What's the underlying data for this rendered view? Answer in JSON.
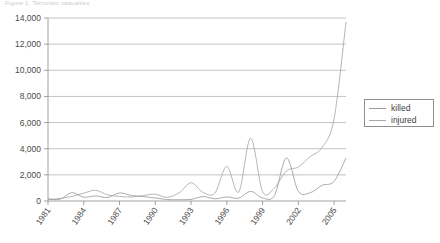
{
  "caption": "Figure 1. Terrorism casualties",
  "legend": {
    "position": "right",
    "items": [
      {
        "label": "killed",
        "icon": "line-swatch-icon",
        "color": "#9b9b9b"
      },
      {
        "label": "injured",
        "icon": "line-swatch-icon",
        "color": "#a8a8a8"
      }
    ]
  },
  "chart_data": {
    "type": "line",
    "title": "",
    "xlabel": "",
    "ylabel": "",
    "grid": true,
    "legend_position": "right",
    "ylim": [
      0,
      14000
    ],
    "ytick_labels": [
      "0",
      "2,000",
      "4,000",
      "6,000",
      "8,000",
      "10,000",
      "12,000",
      "14,000"
    ],
    "ytick_values": [
      0,
      2000,
      4000,
      6000,
      8000,
      10000,
      12000,
      14000
    ],
    "xlim": [
      1981,
      2006
    ],
    "xtick_labels": [
      "1981",
      "1984",
      "1987",
      "1990",
      "1993",
      "1996",
      "1999",
      "2002",
      "2005"
    ],
    "xtick_values": [
      1981,
      1984,
      1987,
      1990,
      1993,
      1996,
      1999,
      2002,
      2005
    ],
    "x": [
      1981,
      1982,
      1983,
      1984,
      1985,
      1986,
      1987,
      1988,
      1989,
      1990,
      1991,
      1992,
      1993,
      1994,
      1995,
      1996,
      1997,
      1998,
      1999,
      2000,
      2001,
      2002,
      2003,
      2004,
      2005,
      2006
    ],
    "series": [
      {
        "name": "killed",
        "color": "#9b9b9b",
        "values": [
          170,
          130,
          640,
          290,
          390,
          270,
          620,
          420,
          340,
          230,
          110,
          100,
          120,
          340,
          170,
          310,
          220,
          740,
          240,
          420,
          3300,
          750,
          630,
          1200,
          1500,
          3300
        ]
      },
      {
        "name": "injured",
        "color": "#a8a8a8",
        "values": [
          100,
          200,
          350,
          600,
          820,
          470,
          350,
          310,
          420,
          520,
          280,
          620,
          1400,
          660,
          610,
          2650,
          690,
          4800,
          720,
          1000,
          2300,
          2600,
          3400,
          4100,
          6300,
          13700
        ]
      }
    ]
  }
}
